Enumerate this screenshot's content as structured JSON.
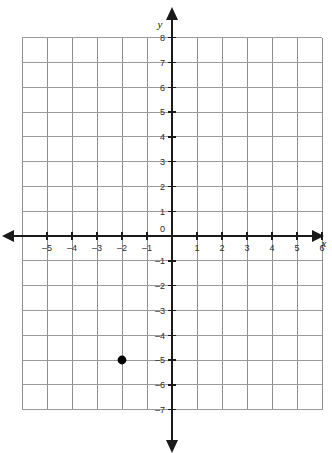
{
  "chart_data": {
    "type": "scatter",
    "title": "",
    "xlabel": "x",
    "ylabel": "y",
    "grid": true,
    "legend": false,
    "xlim": [
      -6,
      7
    ],
    "ylim": [
      -8,
      8
    ],
    "x_tick_labels": [
      "–5",
      "–4",
      "–3",
      "–2",
      "–1",
      "1",
      "2",
      "3",
      "4",
      "5",
      "6"
    ],
    "y_tick_labels": [
      "8",
      "7",
      "6",
      "5",
      "4",
      "3",
      "2",
      "1",
      "–1",
      "–2",
      "–3",
      "–4",
      "–5",
      "–6",
      "–7"
    ],
    "origin_label": "0",
    "x_ticks": [
      -5,
      -4,
      -3,
      -2,
      -1,
      1,
      2,
      3,
      4,
      5,
      6
    ],
    "y_ticks": [
      8,
      7,
      6,
      5,
      4,
      3,
      2,
      1,
      -1,
      -2,
      -3,
      -4,
      -5,
      -6,
      -7
    ],
    "points": [
      {
        "x": -2,
        "y": -5,
        "label": "(–2, –5)"
      }
    ],
    "colors": {
      "grid": "#8f8f8f",
      "grid_minor": "#9a9a9a",
      "axis": "#1a1a1a",
      "point": "#000000",
      "background": "#ffffff",
      "text": "#2b2b2b"
    }
  },
  "axis_labels": {
    "x": "x",
    "y": "y"
  }
}
